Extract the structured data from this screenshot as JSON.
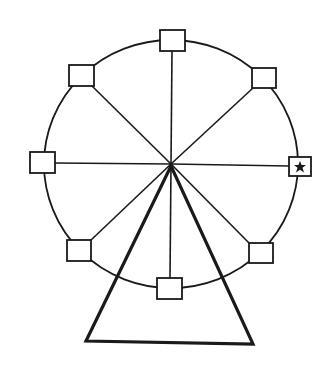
{
  "diagram": {
    "stroke_color": "#1a1a1a",
    "background": "#ffffff",
    "wheel": {
      "center": [
        171,
        164
      ],
      "rx": 127,
      "ry": 124,
      "spoke_count": 8
    },
    "cabins": [
      {
        "id": "top",
        "center": [
          172,
          40
        ],
        "marked": false
      },
      {
        "id": "top-right",
        "center": [
          264,
          78
        ],
        "marked": false
      },
      {
        "id": "right",
        "center": [
          300,
          167
        ],
        "marked": true,
        "mark": "star"
      },
      {
        "id": "bottom-right",
        "center": [
          261,
          253
        ],
        "marked": false
      },
      {
        "id": "bottom",
        "center": [
          169,
          289
        ],
        "marked": false
      },
      {
        "id": "bottom-left",
        "center": [
          79,
          250
        ],
        "marked": false
      },
      {
        "id": "left",
        "center": [
          43,
          163
        ],
        "marked": false
      },
      {
        "id": "top-left",
        "center": [
          81,
          75
        ],
        "marked": false
      }
    ],
    "support": {
      "shape": "triangle",
      "apex": [
        171,
        166
      ],
      "base_left": [
        86,
        341
      ],
      "base_right": [
        253,
        344
      ]
    }
  }
}
